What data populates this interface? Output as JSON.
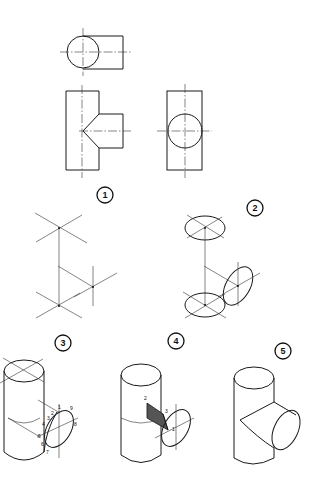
{
  "figure": {
    "steps": [
      {
        "number": "1",
        "label": "Orthographic views and isometric axes"
      },
      {
        "number": "2",
        "label": "Isometric ellipses on axes"
      },
      {
        "number": "3",
        "label": "Intersection points plotted"
      },
      {
        "number": "4",
        "label": "Intersection curve construction"
      },
      {
        "number": "5",
        "label": "Finished isometric T-pipe"
      }
    ],
    "step3_points": [
      "1",
      "2",
      "3",
      "4",
      "5",
      "6",
      "7",
      "8",
      "9"
    ],
    "step4_points": [
      "2",
      "3",
      "1"
    ]
  }
}
